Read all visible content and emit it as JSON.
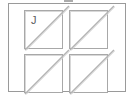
{
  "figure": {
    "title": "",
    "background_color": "#ffffff",
    "frame": {
      "name": "outer-frame",
      "stroke_color": "#9a9a9a",
      "stroke_width": 1
    },
    "marks": [
      {
        "name": "top-edge-smudge",
        "color": "#8f8f8f"
      }
    ],
    "tiles": [
      {
        "position": "top-left",
        "label": "J",
        "diagonal": "bottom-left-to-top-right",
        "stroke_color": "#a8a8a8",
        "diagonal_color": "#b4b4b4"
      },
      {
        "position": "top-right",
        "label": "",
        "diagonal": "bottom-left-to-top-right",
        "stroke_color": "#a8a8a8",
        "diagonal_color": "#b4b4b4"
      },
      {
        "position": "bottom-left",
        "label": "",
        "diagonal": "bottom-left-to-top-right",
        "stroke_color": "#a8a8a8",
        "diagonal_color": "#b4b4b4"
      },
      {
        "position": "bottom-right",
        "label": "",
        "diagonal": "bottom-left-to-top-right",
        "stroke_color": "#a8a8a8",
        "diagonal_color": "#b4b4b4"
      }
    ]
  }
}
